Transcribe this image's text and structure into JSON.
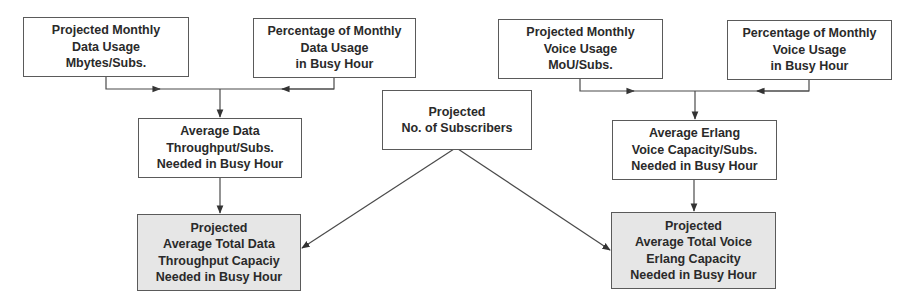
{
  "diagram": {
    "title": "",
    "colors": {
      "line": "#4a4a4a",
      "box_border": "#5a5a5a",
      "box_fill": "#ffffff",
      "result_fill": "#e6e6e6",
      "text": "#2a2a2a"
    },
    "nodes": {
      "data_usage": {
        "lines": [
          "Projected Monthly",
          "Data Usage",
          "Mbytes/Subs."
        ]
      },
      "data_busy_pct": {
        "lines": [
          "Percentage of Monthly",
          "Data Usage",
          "in Busy Hour"
        ]
      },
      "voice_usage": {
        "lines": [
          "Projected Monthly",
          "Voice Usage",
          "MoU/Subs."
        ]
      },
      "voice_busy_pct": {
        "lines": [
          "Percentage of Monthly",
          "Voice Usage",
          "in Busy Hour"
        ]
      },
      "avg_data_throughput": {
        "lines": [
          "Average Data",
          "Throughput/Subs.",
          "Needed in Busy Hour"
        ]
      },
      "subscribers": {
        "lines": [
          "Projected",
          "No. of Subscribers"
        ]
      },
      "avg_erlang": {
        "lines": [
          "Average Erlang",
          "Voice Capacity/Subs.",
          "Needed in Busy Hour"
        ]
      },
      "total_data_capacity": {
        "lines": [
          "Projected",
          "Average Total Data",
          "Throughput Capaciy",
          "Needed in Busy Hour"
        ]
      },
      "total_voice_capacity": {
        "lines": [
          "Projected",
          "Average Total Voice",
          "Erlang Capacity",
          "Needed in Busy Hour"
        ]
      }
    },
    "edges": [
      {
        "from": "data_usage",
        "to": "avg_data_throughput"
      },
      {
        "from": "data_busy_pct",
        "to": "avg_data_throughput"
      },
      {
        "from": "voice_usage",
        "to": "avg_erlang"
      },
      {
        "from": "voice_busy_pct",
        "to": "avg_erlang"
      },
      {
        "from": "avg_data_throughput",
        "to": "total_data_capacity"
      },
      {
        "from": "subscribers",
        "to": "total_data_capacity"
      },
      {
        "from": "avg_erlang",
        "to": "total_voice_capacity"
      },
      {
        "from": "subscribers",
        "to": "total_voice_capacity"
      }
    ]
  }
}
